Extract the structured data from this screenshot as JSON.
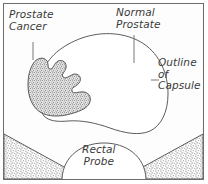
{
  "figure": {
    "background_color": "#fdfdfd",
    "border_color": "#6d6d6d",
    "ink_color": "#4a4a4a",
    "stipple_color": "#8a8a8a"
  },
  "labels": {
    "prostate_cancer": "Prostate\nCancer",
    "normal_prostate": "Normal\nProstate",
    "outline_of_capsule": "Outline\nof\nCapsule",
    "rectal_probe": "Rectal\nProbe"
  },
  "parts": {
    "capsule_outline": "prostate-capsule-outline",
    "tumor": "prostate-cancer-lesion",
    "probe": "rectal-probe-dome",
    "left_tissue": "left-periprostatic-tissue",
    "right_tissue": "right-periprostatic-tissue",
    "leader_cancer": "leader-line-prostate-cancer",
    "leader_normal": "leader-line-normal-prostate",
    "leader_capsule": "leader-line-outline-of-capsule"
  }
}
